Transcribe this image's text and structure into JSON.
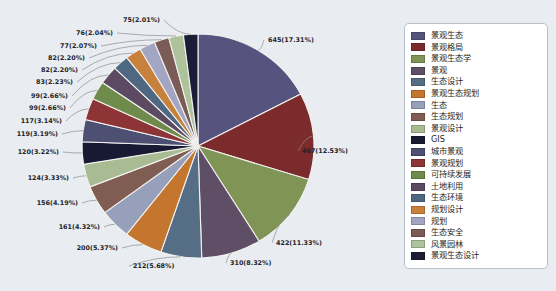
{
  "chart_data": {
    "type": "pie",
    "title": "",
    "legend_position": "right",
    "total": 3727,
    "categories": [
      "景观生态",
      "景观格局",
      "景观生态学",
      "景观",
      "生态设计",
      "景观生态规划",
      "生态",
      "生态规划",
      "景观设计",
      "GIS",
      "城市景观",
      "景观规划",
      "可持续发展",
      "土地利用",
      "生态环境",
      "规划设计",
      "规划",
      "生态安全",
      "风景园林",
      "景观生态设计"
    ],
    "values": [
      645,
      467,
      422,
      310,
      212,
      200,
      161,
      156,
      124,
      120,
      119,
      117,
      99,
      99,
      83,
      82,
      82,
      77,
      76,
      75
    ],
    "percents": [
      "17.31%",
      "12.53%",
      "11.33%",
      "8.32%",
      "5.68%",
      "5.37%",
      "4.32%",
      "4.19%",
      "3.33%",
      "3.22%",
      "3.19%",
      "3.14%",
      "2.66%",
      "2.66%",
      "2.23%",
      "2.20%",
      "2.20%",
      "2.07%",
      "2.04%",
      "2.01%"
    ],
    "labels": [
      "645(17.31%)",
      "467(12.53%)",
      "422(11.33%)",
      "310(8.32%)",
      "212(5.68%)",
      "200(5.37%)",
      "161(4.32%)",
      "156(4.19%)",
      "124(3.33%)",
      "120(3.22%)",
      "119(3.19%)",
      "117(3.14%)",
      "99(2.66%)",
      "99(2.66%)",
      "83(2.23%)",
      "82(2.20%)",
      "82(2.20%)",
      "77(2.07%)",
      "76(2.04%)",
      "75(2.01%)"
    ],
    "colors": [
      "#56537e",
      "#7c2b2c",
      "#7f9455",
      "#5f4f66",
      "#566d86",
      "#c4762f",
      "#97a0bb",
      "#7f5d53",
      "#a9bb92",
      "#181a33",
      "#4d4f73",
      "#8d3536",
      "#6f8b4b",
      "#5c4a63",
      "#4e6881",
      "#c8803d",
      "#a3a6c2",
      "#7b5b56",
      "#aec29b",
      "#1b1c36"
    ]
  },
  "legend": {
    "items": [
      {
        "label": "景观生态",
        "color": "#56537e"
      },
      {
        "label": "景观格局",
        "color": "#7c2b2c"
      },
      {
        "label": "景观生态学",
        "color": "#7f9455"
      },
      {
        "label": "景观",
        "color": "#5f4f66"
      },
      {
        "label": "生态设计",
        "color": "#566d86"
      },
      {
        "label": "景观生态规划",
        "color": "#c4762f"
      },
      {
        "label": "生态",
        "color": "#97a0bb"
      },
      {
        "label": "生态规划",
        "color": "#7f5d53"
      },
      {
        "label": "景观设计",
        "color": "#a9bb92"
      },
      {
        "label": "GIS",
        "color": "#181a33"
      },
      {
        "label": "城市景观",
        "color": "#4d4f73"
      },
      {
        "label": "景观规划",
        "color": "#8d3536"
      },
      {
        "label": "可持续发展",
        "color": "#6f8b4b"
      },
      {
        "label": "土地利用",
        "color": "#5c4a63"
      },
      {
        "label": "生态环境",
        "color": "#4e6881"
      },
      {
        "label": "规划设计",
        "color": "#c8803d"
      },
      {
        "label": "规划",
        "color": "#a3a6c2"
      },
      {
        "label": "生态安全",
        "color": "#7b5b56"
      },
      {
        "label": "风景园林",
        "color": "#aec29b"
      },
      {
        "label": "景观生态设计",
        "color": "#1b1c36"
      }
    ]
  }
}
